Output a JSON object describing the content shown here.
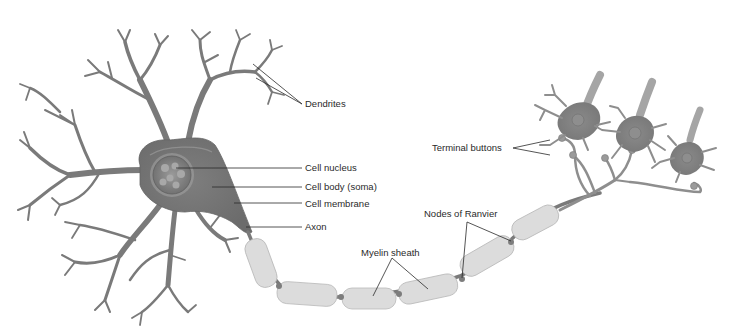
{
  "diagram": {
    "labels": {
      "dendrites": "Dendrites",
      "cell_nucleus": "Cell nucleus",
      "cell_body": "Cell body (soma)",
      "cell_membrane": "Cell membrane",
      "axon": "Axon",
      "myelin_sheath": "Myelin sheath",
      "nodes_of_ranvier": "Nodes of Ranvier",
      "terminal_buttons": "Terminal buttons"
    },
    "colors": {
      "neuron_body": "#7a7a7a",
      "nucleus": "#8a8a8a",
      "myelin": "#dcdcdc",
      "node": "#7d7d7d",
      "label_text": "#2a2a2a",
      "background": "#ffffff"
    }
  }
}
